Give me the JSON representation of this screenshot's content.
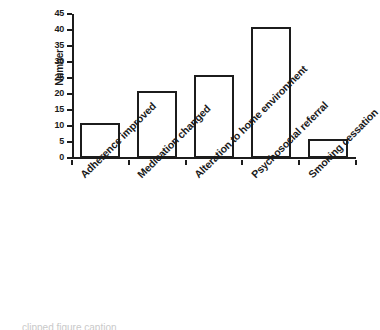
{
  "chart_data": {
    "type": "bar",
    "title": "",
    "xlabel": "",
    "ylabel": "Number",
    "ylim": [
      0,
      45
    ],
    "ytick_labels": [
      "0",
      "5",
      "10",
      "15",
      "20",
      "25",
      "30",
      "35",
      "40",
      "45"
    ],
    "ytick_values": [
      0,
      5,
      10,
      15,
      20,
      25,
      30,
      35,
      40,
      45
    ],
    "grid": false,
    "legend": false,
    "bar_color": "#ffffff",
    "bar_edge_color": "#1c1c1c",
    "axis_color": "#1c1c1c",
    "categories": [
      "Adherence improved",
      "Medication changed",
      "Alteration to home environment",
      "Psychosocial referral",
      "Smoking cessation"
    ],
    "values": [
      11,
      21,
      26,
      41,
      6
    ]
  },
  "caption": {
    "clipped_text": "clipped figure caption"
  }
}
